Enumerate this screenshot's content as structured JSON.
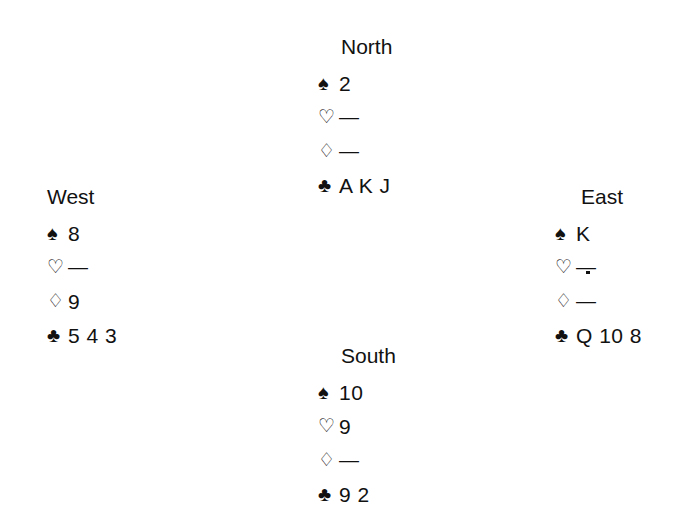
{
  "diagram": {
    "type": "bridge-hand-diagram",
    "background_color": "#ffffff",
    "text_color": "#111111",
    "void_marker": "—",
    "suit_symbols": {
      "spade": "♠",
      "heart": "♡",
      "diamond": "♢",
      "club": "♣"
    }
  },
  "hands": {
    "north": {
      "label": "North",
      "spades": "2",
      "hearts": "—",
      "diamonds": "—",
      "clubs": "A K J"
    },
    "west": {
      "label": "West",
      "spades": "8",
      "hearts": "—",
      "diamonds": "9",
      "clubs": "5 4 3"
    },
    "east": {
      "label": "East",
      "spades": "K",
      "hearts": "—",
      "diamonds": "—",
      "clubs": "Q 10 8"
    },
    "south": {
      "label": "South",
      "spades": "10",
      "hearts": "9",
      "diamonds": "—",
      "clubs": "9 2"
    }
  }
}
